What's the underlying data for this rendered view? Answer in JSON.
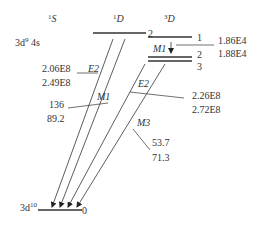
{
  "terms": {
    "singlet_s": {
      "sup": "1",
      "letter": "S"
    },
    "singlet_d": {
      "sup": "1",
      "letter": "D"
    },
    "triplet_d": {
      "sup": "3",
      "letter": "D"
    }
  },
  "configurations": {
    "excited": {
      "base": "3d",
      "sup": "9",
      "rest": " 4s"
    },
    "ground": {
      "base": "3d",
      "sup": "10"
    }
  },
  "levels": {
    "d1_j": "2",
    "t_j1": "1",
    "t_j2": "2",
    "t_j3": "3",
    "ground_j": "0"
  },
  "transitions": {
    "m1_triplet": {
      "label": "M1",
      "values": [
        "1.86E4",
        "1.88E4"
      ]
    },
    "e2_singlet": {
      "label": "E2",
      "values": [
        "2.06E8",
        "2.49E8"
      ]
    },
    "m1_singlet": {
      "label": "M1",
      "values": [
        "136",
        "89.2"
      ]
    },
    "e2_triplet": {
      "label": "E2",
      "values": [
        "2.26E8",
        "2.72E8"
      ]
    },
    "m3_triplet": {
      "label": "M3",
      "values": [
        "53.7",
        "71.3"
      ]
    }
  },
  "colors": {
    "line": "#333333",
    "background": "#ffffff"
  }
}
